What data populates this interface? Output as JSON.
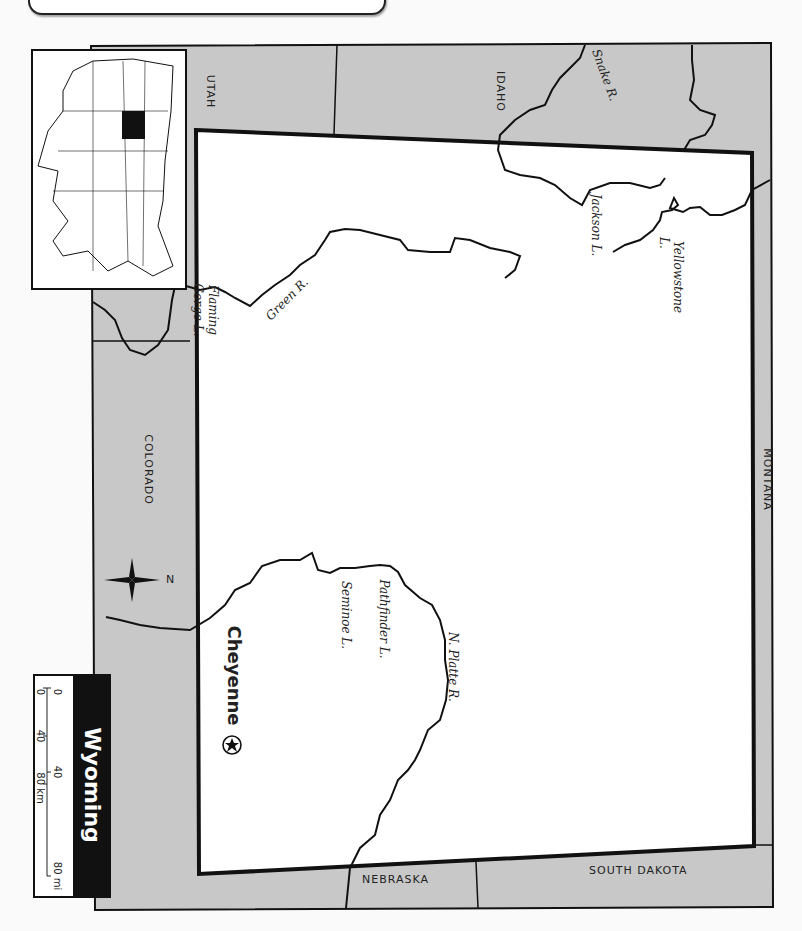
{
  "title": "Wyoming",
  "neighbors": {
    "north": "MONTANA",
    "south": "COLORADO",
    "east_top": "SOUTH DAKOTA",
    "east_bottom": "NEBRASKA",
    "west_top": "IDAHO",
    "west_bottom": "UTAH"
  },
  "waters": {
    "snake": "Snake R.",
    "jackson": "Jackson L.",
    "yellowstone_1": "Yellowstone",
    "yellowstone_2": "L.",
    "green": "Green R.",
    "flaming_1": "Flaming",
    "flaming_2": "Gorge L.",
    "pathfinder": "Pathfinder L.",
    "seminoe": "Seminoe L.",
    "platte": "N. Platte R."
  },
  "capital": {
    "name": "Cheyenne",
    "icon": "star-in-circle-icon"
  },
  "compass": {
    "north_label": "N"
  },
  "scale": {
    "mi_0": "0",
    "mi_40": "40",
    "mi_80": "80 mi",
    "km_0": "0",
    "km_40": "40",
    "km_80": "80 km"
  },
  "colors": {
    "neighbor_fill": "#c8c8c8",
    "state_fill": "#ffffff",
    "border": "#111111"
  }
}
